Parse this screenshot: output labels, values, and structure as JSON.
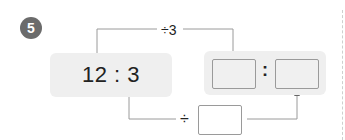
{
  "problem": {
    "number": "5",
    "ratio_text": "12 : 3",
    "top_operation": "÷3",
    "bottom_operation_symbol": "÷",
    "answer_colon": ":",
    "answer_boxes": [
      "",
      ""
    ],
    "divisor_box_value": ""
  },
  "colors": {
    "badge": "#6b6b6b",
    "panel": "#efefef",
    "line": "#9a9a9a",
    "box_border": "#9a9a9a"
  }
}
